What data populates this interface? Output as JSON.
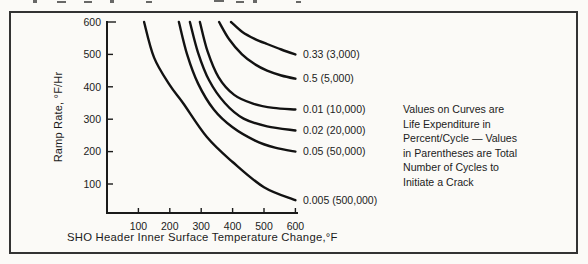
{
  "chart_data": {
    "type": "line",
    "title": "",
    "xlabel": "SHO Header Inner Surface Temperature Change,°F",
    "ylabel": "Ramp Rate, °F/Hr",
    "xlim": [
      0,
      620
    ],
    "ylim": [
      0,
      600
    ],
    "x_ticks": [
      100,
      200,
      300,
      400,
      500,
      600
    ],
    "y_ticks": [
      100,
      200,
      300,
      400,
      500,
      600
    ],
    "grid": false,
    "legend_position": "curve-end-labels",
    "annotation": "Values on Curves are\nLife Expenditure in\nPercent/Cycle — Values\nin Parentheses are Total\nNumber of Cycles to\nInitiate a Crack",
    "series": [
      {
        "label": "0.33 (3,000)",
        "life_expenditure_percent_per_cycle": 0.33,
        "cycles_to_initiate_crack": 3000,
        "points": [
          [
            395,
            600
          ],
          [
            430,
            570
          ],
          [
            470,
            548
          ],
          [
            510,
            532
          ],
          [
            555,
            515
          ],
          [
            600,
            500
          ]
        ]
      },
      {
        "label": "0.5 (5,000)",
        "life_expenditure_percent_per_cycle": 0.5,
        "cycles_to_initiate_crack": 5000,
        "points": [
          [
            357,
            600
          ],
          [
            390,
            545
          ],
          [
            430,
            500
          ],
          [
            470,
            470
          ],
          [
            510,
            450
          ],
          [
            555,
            435
          ],
          [
            600,
            425
          ]
        ]
      },
      {
        "label": "0.01 (10,000)",
        "life_expenditure_percent_per_cycle": 0.01,
        "cycles_to_initiate_crack": 10000,
        "points": [
          [
            296,
            600
          ],
          [
            320,
            510
          ],
          [
            355,
            430
          ],
          [
            405,
            375
          ],
          [
            465,
            348
          ],
          [
            530,
            335
          ],
          [
            600,
            330
          ]
        ]
      },
      {
        "label": "0.02 (20,000)",
        "life_expenditure_percent_per_cycle": 0.02,
        "cycles_to_initiate_crack": 20000,
        "points": [
          [
            264,
            600
          ],
          [
            290,
            505
          ],
          [
            325,
            420
          ],
          [
            375,
            350
          ],
          [
            435,
            302
          ],
          [
            510,
            278
          ],
          [
            600,
            265
          ]
        ]
      },
      {
        "label": "0.05 (50,000)",
        "life_expenditure_percent_per_cycle": 0.05,
        "cycles_to_initiate_crack": 50000,
        "points": [
          [
            229,
            600
          ],
          [
            255,
            500
          ],
          [
            290,
            410
          ],
          [
            340,
            330
          ],
          [
            400,
            275
          ],
          [
            470,
            235
          ],
          [
            535,
            212
          ],
          [
            600,
            200
          ]
        ]
      },
      {
        "label": "0.005 (500,000)",
        "life_expenditure_percent_per_cycle": 0.005,
        "cycles_to_initiate_crack": 500000,
        "points": [
          [
            118,
            600
          ],
          [
            150,
            490
          ],
          [
            200,
            405
          ],
          [
            242,
            350
          ],
          [
            318,
            245
          ],
          [
            400,
            168
          ],
          [
            500,
            90
          ],
          [
            600,
            50
          ]
        ]
      }
    ]
  },
  "colors": {
    "curve": "#121212",
    "axis": "#1a1a1a",
    "text": "#1c1c1c",
    "frame": "#333333",
    "background": "#fbfaf7"
  }
}
